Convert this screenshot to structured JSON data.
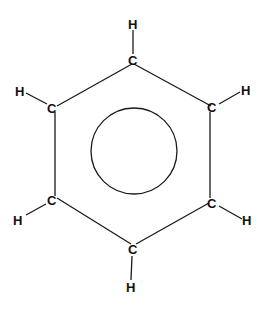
{
  "diagram": {
    "colors": {
      "line": "#1a1a1a",
      "background": "#ffffff"
    },
    "atoms": {
      "c_top": "C",
      "h_top": "H",
      "c_upper_left": "C",
      "h_upper_left": "H",
      "c_upper_right": "C",
      "h_upper_right": "H",
      "c_lower_left": "C",
      "h_lower_left": "H",
      "c_lower_right": "C",
      "h_lower_right": "H",
      "c_bottom": "C",
      "h_bottom": "H"
    }
  }
}
